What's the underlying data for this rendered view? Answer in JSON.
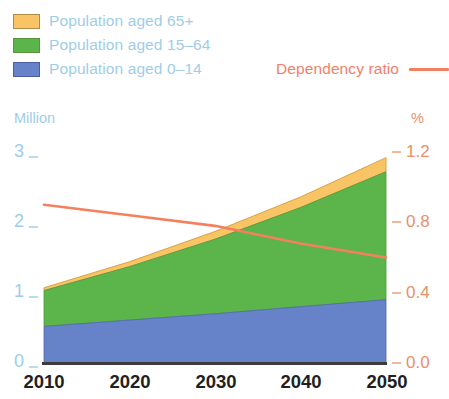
{
  "legend": {
    "series": [
      {
        "label": "Population aged 65+",
        "color": "#f8c466",
        "key": "age65"
      },
      {
        "label": "Population aged 15–64",
        "color": "#5cb54a",
        "key": "age1564"
      },
      {
        "label": "Population aged 0–14",
        "color": "#6682c9",
        "key": "age014"
      }
    ],
    "line": {
      "label": "Dependency ratio",
      "color": "#f4805f"
    }
  },
  "axes": {
    "left_title": "Million",
    "right_title": "%",
    "left_ticks": [
      "3",
      "2",
      "1",
      "0"
    ],
    "right_ticks": [
      "1.2",
      "0.8",
      "0.4",
      "0.0"
    ],
    "x_ticks": [
      "2010",
      "2020",
      "2030",
      "2040",
      "2050"
    ]
  },
  "chart_data": {
    "type": "area",
    "title": "",
    "subtitle": "",
    "xlabel": "",
    "ylabel": "Million",
    "y2label": "%",
    "x": [
      2010,
      2020,
      2030,
      2040,
      2050
    ],
    "xlim": [
      2010,
      2050
    ],
    "ylim": [
      0,
      3
    ],
    "y2lim": [
      0.0,
      1.2
    ],
    "ytick_values": [
      0,
      1,
      2,
      3
    ],
    "y2tick_values": [
      0.0,
      0.4,
      0.8,
      1.2
    ],
    "grid": false,
    "legend_position": "top-left",
    "stacked": true,
    "series": [
      {
        "name": "Population aged 0–14",
        "color": "#6682c9",
        "axis": "left",
        "values": [
          0.52,
          0.61,
          0.7,
          0.8,
          0.9
        ]
      },
      {
        "name": "Population aged 15–64",
        "color": "#5cb54a",
        "axis": "left",
        "values": [
          0.51,
          0.76,
          1.06,
          1.41,
          1.82
        ]
      },
      {
        "name": "Population aged 65+",
        "color": "#f8c466",
        "axis": "left",
        "values": [
          0.04,
          0.07,
          0.11,
          0.15,
          0.2
        ]
      }
    ],
    "cumulative": [
      {
        "name": "0–14 top",
        "values": [
          0.52,
          0.61,
          0.7,
          0.8,
          0.9
        ]
      },
      {
        "name": "15–64 top",
        "values": [
          1.03,
          1.37,
          1.76,
          2.21,
          2.72
        ]
      },
      {
        "name": "65+ top (total)",
        "values": [
          1.07,
          1.44,
          1.87,
          2.36,
          2.92
        ]
      }
    ],
    "line_series": [
      {
        "name": "Dependency ratio",
        "color": "#f4805f",
        "axis": "right",
        "values": [
          0.9,
          0.84,
          0.78,
          0.68,
          0.6
        ]
      }
    ]
  },
  "colors": {
    "age65": "#f8c466",
    "age1564": "#5cb54a",
    "age014": "#6682c9",
    "line": "#f4805f",
    "left_axis_text": "#9ecde8",
    "right_axis_text": "#e8906a",
    "x_axis_text": "#231f20",
    "background": "#ffffff"
  }
}
